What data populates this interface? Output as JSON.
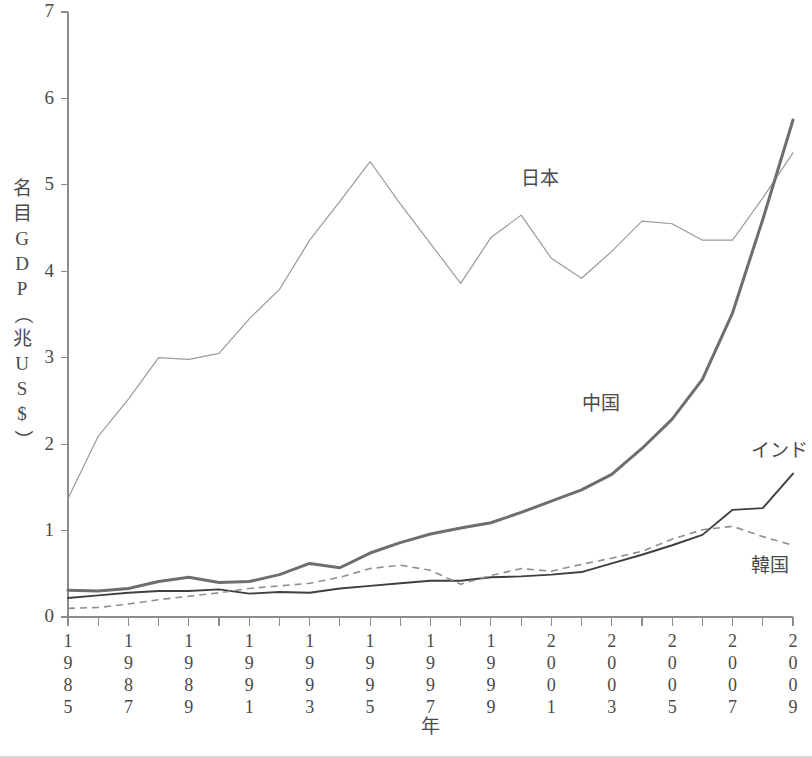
{
  "chart_data": {
    "type": "line",
    "title": "",
    "xlabel": "年",
    "ylabel": "名目GDP（兆US$）",
    "ylabel_chars": [
      "名",
      "目",
      "G",
      "D",
      "P",
      "（",
      "兆",
      "U",
      "S",
      "$",
      "）"
    ],
    "xlabel_chars": [
      "年"
    ],
    "x": [
      1985,
      1986,
      1987,
      1988,
      1989,
      1990,
      1991,
      1992,
      1993,
      1994,
      1995,
      1996,
      1997,
      1998,
      1999,
      2000,
      2001,
      2002,
      2003,
      2004,
      2005,
      2006,
      2007,
      2008,
      2009
    ],
    "xlim": [
      1985,
      2009
    ],
    "ylim": [
      0,
      7
    ],
    "yticks": [
      0,
      1,
      2,
      3,
      4,
      5,
      6,
      7
    ],
    "ytick_labels": [
      "0",
      "1",
      "2",
      "3",
      "4",
      "5",
      "6",
      "7"
    ],
    "xticks_labeled": [
      1985,
      1987,
      1989,
      1991,
      1993,
      1995,
      1997,
      1999,
      2001,
      2003,
      2005,
      2007,
      2009
    ],
    "xtick_labels": [
      "1985",
      "1987",
      "1989",
      "1991",
      "1993",
      "1995",
      "1997",
      "1999",
      "2001",
      "2003",
      "2005",
      "2007",
      "2009"
    ],
    "xtick_orientation": "vertical-digits",
    "grid": false,
    "legend": "inline-annotations",
    "series": [
      {
        "name": "日本",
        "key": "japan",
        "style": "thin-solid-light",
        "color": "#9a9a9a",
        "label_x": 2000,
        "label_y": 5.0,
        "values": [
          1.37,
          2.09,
          2.52,
          3.0,
          2.98,
          3.05,
          3.45,
          3.79,
          4.36,
          4.81,
          5.27,
          4.78,
          4.32,
          3.86,
          4.39,
          4.65,
          4.15,
          3.92,
          4.23,
          4.58,
          4.55,
          4.36,
          4.36,
          4.85,
          5.37
        ]
      },
      {
        "name": "中国",
        "key": "china",
        "style": "thick-solid-gray",
        "color": "#6e6e6e",
        "label_x": 2002,
        "label_y": 2.4,
        "values": [
          0.31,
          0.3,
          0.33,
          0.41,
          0.46,
          0.4,
          0.41,
          0.49,
          0.62,
          0.57,
          0.74,
          0.86,
          0.96,
          1.03,
          1.09,
          1.21,
          1.34,
          1.47,
          1.65,
          1.95,
          2.29,
          2.75,
          3.52,
          4.6,
          5.75
        ]
      },
      {
        "name": "インド",
        "key": "india",
        "style": "medium-solid-dark",
        "color": "#3f3f3f",
        "label_x": 2007.6,
        "label_y": 1.85,
        "values": [
          0.22,
          0.25,
          0.28,
          0.3,
          0.3,
          0.32,
          0.27,
          0.29,
          0.28,
          0.33,
          0.36,
          0.39,
          0.42,
          0.42,
          0.46,
          0.47,
          0.49,
          0.52,
          0.62,
          0.72,
          0.83,
          0.95,
          1.24,
          1.26,
          1.66
        ]
      },
      {
        "name": "韓国",
        "key": "korea",
        "style": "dashed-gray",
        "color": "#8f8f8f",
        "label_x": 2007.6,
        "label_y": 0.52,
        "values": [
          0.1,
          0.11,
          0.15,
          0.2,
          0.24,
          0.28,
          0.33,
          0.36,
          0.39,
          0.46,
          0.56,
          0.6,
          0.54,
          0.38,
          0.48,
          0.56,
          0.53,
          0.61,
          0.68,
          0.76,
          0.9,
          1.01,
          1.05,
          0.93,
          0.83
        ]
      }
    ]
  },
  "axes": {
    "y_axis_name": "名目GDP（兆US$）",
    "x_axis_name": "年"
  }
}
